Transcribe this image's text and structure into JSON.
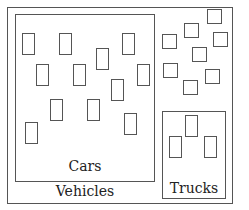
{
  "diagram": {
    "type": "venn-set-diagram",
    "outer": {
      "label": "Vehicles",
      "x": 7,
      "y": 7,
      "w": 226,
      "h": 197
    },
    "cars": {
      "label": "Cars",
      "x": 15,
      "y": 14,
      "w": 140,
      "h": 168,
      "items": [
        {
          "x": 22,
          "y": 33
        },
        {
          "x": 59,
          "y": 33
        },
        {
          "x": 122,
          "y": 33
        },
        {
          "x": 96,
          "y": 48
        },
        {
          "x": 36,
          "y": 64
        },
        {
          "x": 73,
          "y": 64
        },
        {
          "x": 137,
          "y": 64
        },
        {
          "x": 111,
          "y": 79
        },
        {
          "x": 50,
          "y": 99
        },
        {
          "x": 87,
          "y": 99
        },
        {
          "x": 124,
          "y": 113
        },
        {
          "x": 25,
          "y": 122
        }
      ],
      "item_w": 13,
      "item_h": 22
    },
    "trucks": {
      "label": "Trucks",
      "x": 162,
      "y": 111,
      "w": 64,
      "h": 88,
      "items": [
        {
          "x": 185,
          "y": 115
        },
        {
          "x": 169,
          "y": 136
        },
        {
          "x": 204,
          "y": 136
        }
      ],
      "item_w": 13,
      "item_h": 22
    },
    "other_vehicles": {
      "items": [
        {
          "x": 207,
          "y": 9
        },
        {
          "x": 184,
          "y": 23
        },
        {
          "x": 162,
          "y": 34
        },
        {
          "x": 213,
          "y": 32
        },
        {
          "x": 192,
          "y": 47
        },
        {
          "x": 163,
          "y": 63
        },
        {
          "x": 205,
          "y": 69
        },
        {
          "x": 183,
          "y": 80
        }
      ],
      "item_w": 15,
      "item_h": 15
    }
  }
}
